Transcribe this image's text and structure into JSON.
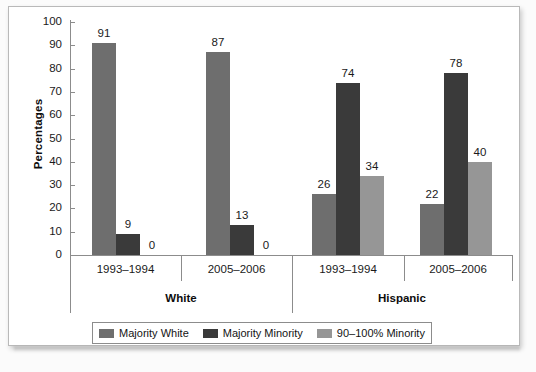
{
  "chart_data": {
    "type": "bar",
    "title": "",
    "xlabel": "",
    "ylabel": "Percentages",
    "ylim": [
      0,
      100
    ],
    "ytick_step": 10,
    "yticks": [
      "100",
      "90",
      "80",
      "70",
      "60",
      "50",
      "40",
      "30",
      "20",
      "10",
      "0"
    ],
    "grid": false,
    "legend_position": "bottom-center",
    "groups": [
      "White",
      "Hispanic"
    ],
    "categories": [
      "1993–1994",
      "2005–2006",
      "1993–1994",
      "2005–2006"
    ],
    "series": [
      {
        "name": "Majority White",
        "color": "#6e6e6e",
        "values": [
          91,
          87,
          26,
          22
        ]
      },
      {
        "name": "Majority Minority",
        "color": "#3a3a3a",
        "values": [
          9,
          13,
          74,
          78
        ]
      },
      {
        "name": "90–100% Minority",
        "color": "#969696",
        "values": [
          0,
          0,
          34,
          40
        ]
      }
    ],
    "clusters": [
      {
        "group": "White",
        "period": "1993–1994",
        "bars": [
          {
            "series": "Majority White",
            "value": 91,
            "label": "91",
            "color": "#6e6e6e"
          },
          {
            "series": "Majority Minority",
            "value": 9,
            "label": "9",
            "color": "#3a3a3a"
          },
          {
            "series": "90–100% Minority",
            "value": 0,
            "label": "0",
            "color": "#969696"
          }
        ]
      },
      {
        "group": "White",
        "period": "2005–2006",
        "bars": [
          {
            "series": "Majority White",
            "value": 87,
            "label": "87",
            "color": "#6e6e6e"
          },
          {
            "series": "Majority Minority",
            "value": 13,
            "label": "13",
            "color": "#3a3a3a"
          },
          {
            "series": "90–100% Minority",
            "value": 0,
            "label": "0",
            "color": "#969696"
          }
        ]
      },
      {
        "group": "Hispanic",
        "period": "1993–1994",
        "bars": [
          {
            "series": "Majority White",
            "value": 26,
            "label": "26",
            "color": "#6e6e6e"
          },
          {
            "series": "Majority Minority",
            "value": 74,
            "label": "74",
            "color": "#3a3a3a"
          },
          {
            "series": "90–100% Minority",
            "value": 34,
            "label": "34",
            "color": "#969696"
          }
        ]
      },
      {
        "group": "Hispanic",
        "period": "2005–2006",
        "bars": [
          {
            "series": "Majority White",
            "value": 22,
            "label": "22",
            "color": "#6e6e6e"
          },
          {
            "series": "Majority Minority",
            "value": 78,
            "label": "78",
            "color": "#3a3a3a"
          },
          {
            "series": "90–100% Minority",
            "value": 40,
            "label": "40",
            "color": "#969696"
          }
        ]
      }
    ]
  },
  "axis": {
    "y_title": "Percentages"
  },
  "legend": {
    "items": [
      {
        "label": "Majority White",
        "color": "#6e6e6e"
      },
      {
        "label": "Majority Minority",
        "color": "#3a3a3a"
      },
      {
        "label": "90–100% Minority",
        "color": "#969696"
      }
    ]
  }
}
